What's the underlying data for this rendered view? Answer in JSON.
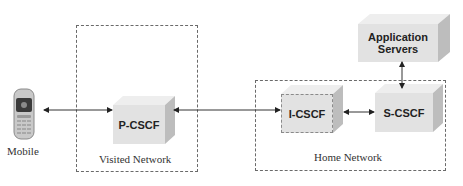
{
  "diagram": {
    "nodes": {
      "mobile": {
        "label": "Mobile",
        "icon": "mobile-phone-icon"
      },
      "pcscf": {
        "label": "P-CSCF"
      },
      "icscf": {
        "label": "I-CSCF"
      },
      "scscf": {
        "label": "S-CSCF"
      },
      "app_servers": {
        "label_line1": "Application",
        "label_line2": "Servers"
      }
    },
    "regions": {
      "visited": {
        "label": "Visited Network"
      },
      "home": {
        "label": "Home Network"
      }
    },
    "edges": [
      {
        "from": "Mobile",
        "to": "P-CSCF",
        "type": "bidirectional"
      },
      {
        "from": "P-CSCF",
        "to": "I-CSCF",
        "type": "bidirectional"
      },
      {
        "from": "I-CSCF",
        "to": "S-CSCF",
        "type": "bidirectional"
      },
      {
        "from": "S-CSCF",
        "to": "Application Servers",
        "type": "bidirectional"
      }
    ],
    "colors": {
      "box_front": "#e2e2e2",
      "box_side": "#bdbdbd",
      "box_top": "#eeeeee",
      "line": "#222222"
    }
  }
}
